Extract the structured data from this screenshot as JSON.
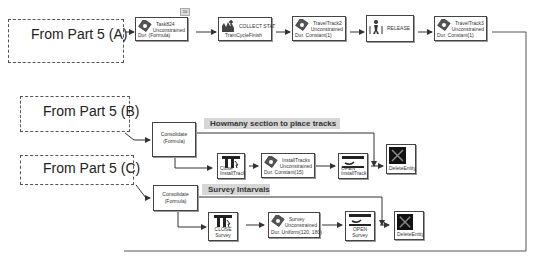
{
  "sources": {
    "a": "From Part 5 (A)",
    "b": "From Part 5 (B)",
    "c": "From  Part 5 (C)"
  },
  "row_a": {
    "badge": "10",
    "task824": {
      "name": "Task824",
      "mode": "Unconstrained",
      "dur": "Dur. (Formula)"
    },
    "collect": {
      "name": "COLLECT STAT",
      "sub": "TrainCycleFinish"
    },
    "travel2": {
      "name": "TravelTrack2",
      "mode": "Unconstrained",
      "dur": "Dur. Constant(1)"
    },
    "release": {
      "name": "RELEASE"
    },
    "travel3": {
      "name": "TravelTrack3",
      "mode": "Unconstrained",
      "dur": "Dur. Constant(1)"
    }
  },
  "row_b": {
    "consolidate": {
      "line1": "Consolidate",
      "line2": "(Formula)"
    },
    "label": "Howmany section to place tracks",
    "close": {
      "line1": "Close",
      "line2": "InstallTrack"
    },
    "install": {
      "name": "InstallTracks",
      "mode": "Unconstrained",
      "dur": "Dur. Constant(15)"
    },
    "open": {
      "line1": "OPEN",
      "line2": "InstallTrack"
    },
    "delete": "DeleteEntity"
  },
  "row_c": {
    "consolidate": {
      "line1": "Consolidate",
      "line2": "(Formula)"
    },
    "label": "Survey Intarvals",
    "close": {
      "line1": "CLOSE",
      "line2": "Survey"
    },
    "survey": {
      "name": "Survey",
      "mode": "Unconstrained",
      "dur": "Dur. Uniform(120, 180)"
    },
    "open": {
      "line1": "OPEN",
      "line2": "Survey"
    },
    "delete": "DeleteEntity"
  },
  "colors": {
    "line": "#333333",
    "label_bg": "#d6d6d6",
    "block_border": "#444444"
  }
}
